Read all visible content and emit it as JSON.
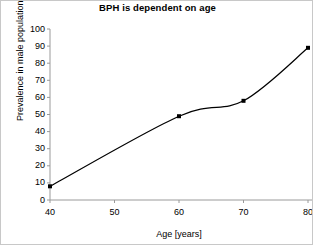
{
  "chart_data": {
    "type": "line",
    "title": "BPH is dependent on age",
    "xlabel": "Age [years]",
    "ylabel": "Prevalence in male population [%]",
    "x": [
      40,
      60,
      70,
      80
    ],
    "values": [
      8,
      49,
      58,
      89
    ],
    "series": [
      {
        "name": "Prevalence of BPH",
        "x": [
          40,
          60,
          70,
          80
        ],
        "values": [
          8,
          49,
          58,
          89
        ]
      }
    ],
    "xlim": [
      40,
      80
    ],
    "ylim": [
      0,
      100
    ],
    "xticks": [
      40,
      50,
      60,
      70,
      80
    ],
    "yticks": [
      0,
      10,
      20,
      30,
      40,
      50,
      60,
      70,
      80,
      90,
      100
    ],
    "xtick_labels": [
      "40",
      "50",
      "60",
      "70",
      "80"
    ],
    "ytick_labels": [
      "0",
      "10",
      "20",
      "30",
      "40",
      "50",
      "60",
      "70",
      "80",
      "90",
      "100"
    ],
    "grid": false,
    "legend": false,
    "smooth": true,
    "marker": "square",
    "line_color": "#000000",
    "marker_color": "#000000",
    "axis_color": "#808080",
    "background_color": "#ffffff",
    "annotations": []
  }
}
